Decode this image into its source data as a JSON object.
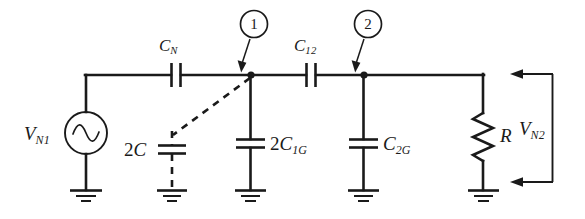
{
  "figure": {
    "type": "electrical-circuit-schematic",
    "title": "",
    "background_color": "#ffffff",
    "line_color": "#1a1a1a",
    "width": 585,
    "height": 219
  },
  "sources": [
    {
      "name": "voltage-source-vn1",
      "symbol": "ac-sine-source",
      "label_main": "V",
      "label_sub": "N1",
      "label_full": "V_N1"
    }
  ],
  "node_markers": [
    {
      "name": "node-marker-1",
      "number": "1"
    },
    {
      "name": "node-marker-2",
      "number": "2"
    }
  ],
  "series_capacitors": [
    {
      "name": "capacitor-cn",
      "label_main": "C",
      "label_sub": "N",
      "label_full": "C_N",
      "style": "solid"
    },
    {
      "name": "capacitor-c12",
      "label_main": "C",
      "label_sub": "12",
      "label_full": "C_12",
      "style": "solid"
    }
  ],
  "shunt_capacitors": [
    {
      "name": "capacitor-2c",
      "prefix": "2",
      "label_main": "C",
      "label_sub": "",
      "label_full": "2C",
      "style": "dashed"
    },
    {
      "name": "capacitor-2c1g",
      "prefix": "2",
      "label_main": "C",
      "label_sub": "1G",
      "label_full": "2C_1G",
      "style": "solid"
    },
    {
      "name": "capacitor-c2g",
      "prefix": "",
      "label_main": "C",
      "label_sub": "2G",
      "label_full": "C_2G",
      "style": "solid"
    }
  ],
  "resistors": [
    {
      "name": "resistor-r",
      "label_main": "R",
      "label_sub": "",
      "label_full": "R",
      "style": "zigzag"
    }
  ],
  "measurements": [
    {
      "name": "voltage-vn2",
      "label_main": "V",
      "label_sub": "N2",
      "label_full": "V_N2",
      "annotation": "port voltage measured across R with arrows"
    }
  ],
  "grounds": [
    {
      "name": "ground-source"
    },
    {
      "name": "ground-2c"
    },
    {
      "name": "ground-2c1g"
    },
    {
      "name": "ground-c2g"
    },
    {
      "name": "ground-r"
    }
  ]
}
